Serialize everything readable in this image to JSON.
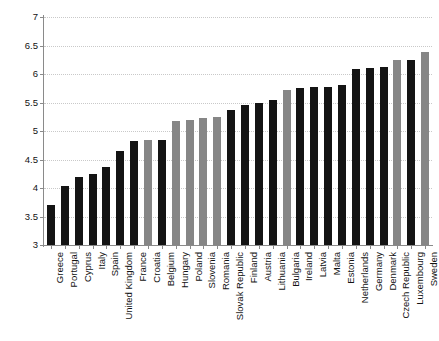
{
  "chart_data": {
    "type": "bar",
    "title": "",
    "subtitle": "",
    "xlabel": "",
    "ylabel": "",
    "ylim": [
      3,
      7
    ],
    "yticks": [
      3,
      3.5,
      4,
      4.5,
      5,
      5.5,
      6,
      6.5,
      7
    ],
    "ytick_labels": [
      "3",
      "3.5",
      "4",
      "4.5",
      "5",
      "5.5",
      "6",
      "6.5",
      "7"
    ],
    "grid": true,
    "legend": "none",
    "bar_colors": {
      "black": "#141414",
      "gray": "#868686"
    },
    "categories": [
      "Greece",
      "Portugal",
      "Cyprus",
      "Italy",
      "Spain",
      "United Kingdom",
      "France",
      "Croatia",
      "Belgium",
      "Hungary",
      "Poland",
      "Slovenia",
      "Romania",
      "Slovak Republic",
      "Finland",
      "Austria",
      "Lithuania",
      "Bulgaria",
      "Ireland",
      "Latvia",
      "Malta",
      "Estonia",
      "Netherlands",
      "Germany",
      "Denmark",
      "Czech Republic",
      "Luxembourg",
      "Sweden"
    ],
    "values": [
      3.7,
      4.04,
      4.19,
      4.25,
      4.36,
      4.65,
      4.82,
      4.85,
      4.85,
      5.17,
      5.2,
      5.22,
      5.25,
      5.36,
      5.46,
      5.5,
      5.55,
      5.72,
      5.76,
      5.77,
      5.78,
      5.8,
      6.09,
      6.1,
      6.12,
      6.24,
      6.25,
      6.39
    ],
    "colors": [
      "black",
      "black",
      "black",
      "black",
      "black",
      "black",
      "black",
      "gray",
      "black",
      "gray",
      "gray",
      "gray",
      "gray",
      "black",
      "black",
      "black",
      "black",
      "gray",
      "black",
      "black",
      "black",
      "black",
      "black",
      "black",
      "black",
      "gray",
      "black",
      "gray"
    ]
  }
}
